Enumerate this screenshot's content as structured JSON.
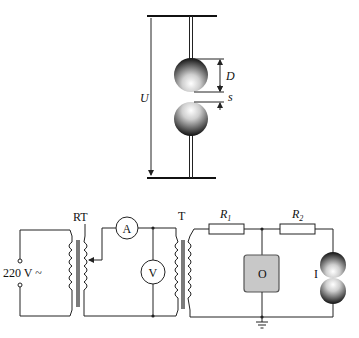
{
  "gap_assembly": {
    "voltage_label": "U",
    "diameter_label": "D",
    "gap_label": "s"
  },
  "circuit": {
    "source_label": "220 V ~",
    "regulating_transformer_label": "RT",
    "ammeter_label": "A",
    "voltmeter_label": "V",
    "transformer_label": "T",
    "resistor1": {
      "letter": "R",
      "sub": "1"
    },
    "resistor2": {
      "letter": "R",
      "sub": "2"
    },
    "oscilloscope_label": "O",
    "sphere_gap_label": "I"
  },
  "colors": {
    "line": "#222222",
    "oscilloscope_fill": "#c8c8c8",
    "background": "#ffffff"
  }
}
